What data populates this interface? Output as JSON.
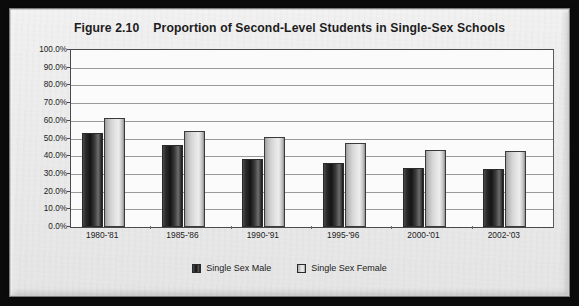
{
  "figure": {
    "number_label": "Figure 2.10",
    "title": "Proportion of Second-Level Students in Single-Sex Schools"
  },
  "chart_data": {
    "type": "bar",
    "xlabel": "",
    "ylabel": "",
    "ylim": [
      0,
      100
    ],
    "ytick_labels": [
      "100.0%",
      "90.0%",
      "80.0%",
      "70.0%",
      "60.0%",
      "50.0%",
      "40.0%",
      "30.0%",
      "20.0%",
      "10.0%",
      "0.0%"
    ],
    "ytick_values": [
      100,
      90,
      80,
      70,
      60,
      50,
      40,
      30,
      20,
      10,
      0
    ],
    "grid": true,
    "legend_position": "bottom-center",
    "categories": [
      "1980-'81",
      "1985-'86",
      "1990-'91",
      "1995-'96",
      "2000-'01",
      "2002-'03"
    ],
    "series": [
      {
        "name": "Single Sex Male",
        "color": "#1a1a1a",
        "values": [
          53.0,
          46.3,
          38.6,
          36.0,
          33.3,
          32.9
        ]
      },
      {
        "name": "Single Sex Female",
        "color": "#dcdcdc",
        "values": [
          61.4,
          54.2,
          51.0,
          47.6,
          43.5,
          43.1
        ]
      }
    ]
  },
  "legend": {
    "items": [
      {
        "label": "Single Sex Male"
      },
      {
        "label": "Single Sex Female"
      }
    ]
  }
}
